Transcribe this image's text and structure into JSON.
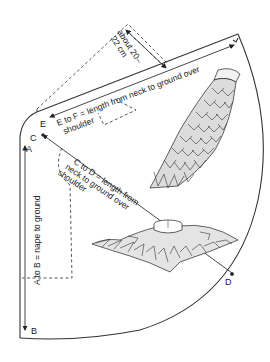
{
  "diagram": {
    "type": "sewing-pattern",
    "colors": {
      "line": "#333333",
      "background": "#ffffff",
      "feather_fill": "#e8e8e8"
    },
    "points": {
      "A": "A",
      "B": "B",
      "C": "C",
      "D": "D",
      "E": "E"
    },
    "labels": {
      "collar_width_line1": "about 20–",
      "collar_width_line2": "22 cm",
      "e_to_f_line1": "E to F = length from neck to ground over",
      "e_to_f_line2": "shoulder",
      "c_to_d_line1": "C to D = length from",
      "c_to_d_line2": "neck to ground over",
      "c_to_d_line3": "shoulder",
      "a_to_b": "A to B = nape to ground"
    },
    "illustrations": [
      {
        "name": "feather-cape-side-view",
        "description": "tall feathered cape seen from side"
      },
      {
        "name": "feather-cape-top-view",
        "description": "spread feathered cape seen from above"
      }
    ]
  }
}
